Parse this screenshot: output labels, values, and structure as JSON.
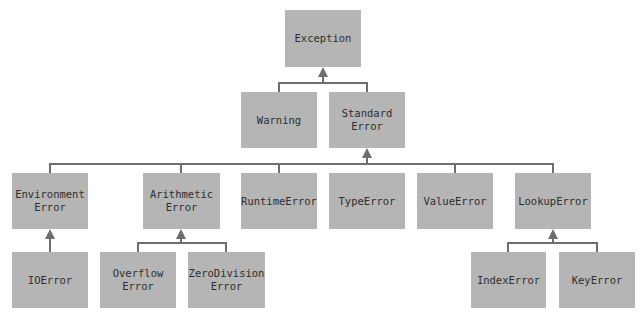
{
  "diagram": {
    "colors": {
      "box": "#b5b5b5",
      "line": "#6e6e6e",
      "text": "#2e2e2e"
    },
    "nodes": {
      "exception": "Exception",
      "warning": "Warning",
      "standard_error": "Standard\nError",
      "environment_error": "Environment\nError",
      "arithmetic_error": "Arithmetic\nError",
      "runtime_error": "RuntimeError",
      "type_error": "TypeError",
      "value_error": "ValueError",
      "lookup_error": "LookupError",
      "io_error": "IOError",
      "overflow_error": "Overflow\nError",
      "zerodivision_error": "ZeroDivision\nError",
      "index_error": "IndexError",
      "key_error": "KeyError"
    },
    "edges": [
      [
        "warning",
        "exception"
      ],
      [
        "standard_error",
        "exception"
      ],
      [
        "environment_error",
        "standard_error"
      ],
      [
        "arithmetic_error",
        "standard_error"
      ],
      [
        "runtime_error",
        "standard_error"
      ],
      [
        "type_error",
        "standard_error"
      ],
      [
        "value_error",
        "standard_error"
      ],
      [
        "lookup_error",
        "standard_error"
      ],
      [
        "io_error",
        "environment_error"
      ],
      [
        "overflow_error",
        "arithmetic_error"
      ],
      [
        "zerodivision_error",
        "arithmetic_error"
      ],
      [
        "index_error",
        "lookup_error"
      ],
      [
        "key_error",
        "lookup_error"
      ]
    ]
  }
}
